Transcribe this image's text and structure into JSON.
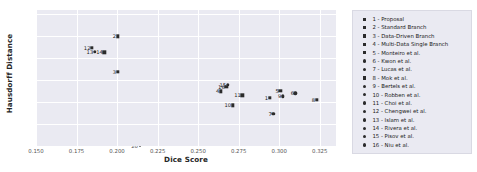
{
  "chart_data": {
    "type": "scatter",
    "title": "",
    "xlabel": "Dice Score",
    "ylabel": "Hausdorff Distance",
    "xlim": [
      0.15,
      0.335
    ],
    "ylim": [
      20,
      82
    ],
    "xticks": [
      "0.150",
      "0.175",
      "0.200",
      "0.225",
      "0.250",
      "0.275",
      "0.300",
      "0.325"
    ],
    "xtick_values": [
      0.15,
      0.175,
      0.2,
      0.225,
      0.25,
      0.275,
      0.3,
      0.325
    ],
    "yticks": [
      "20",
      "30",
      "40",
      "50",
      "60",
      "70",
      "80"
    ],
    "ytick_values": [
      20,
      30,
      40,
      50,
      60,
      70,
      80
    ],
    "grid": true,
    "legend_position": "right",
    "points": [
      {
        "label": "1",
        "name": "1 - Proposal",
        "x": 0.294,
        "y": 42.0,
        "marker": "square"
      },
      {
        "label": "2",
        "name": "2 - Standard Branch",
        "x": 0.2003,
        "y": 70.0,
        "marker": "square"
      },
      {
        "label": "3",
        "name": "3 - Data-Driven Branch",
        "x": 0.2003,
        "y": 53.8,
        "marker": "square"
      },
      {
        "label": "4",
        "name": "4 - Multi-Data Single Branch",
        "x": 0.264,
        "y": 45.0,
        "marker": "square"
      },
      {
        "label": "5",
        "name": "5 - Monteiro et al.",
        "x": 0.3006,
        "y": 45.3,
        "marker": "square"
      },
      {
        "label": "6",
        "name": "6 - Kwon et al.",
        "x": 0.31,
        "y": 44.0,
        "marker": "circle"
      },
      {
        "label": "7",
        "name": "7 - Lucas et al.",
        "x": 0.2963,
        "y": 34.6,
        "marker": "circle"
      },
      {
        "label": "8",
        "name": "8 - Mok et al.",
        "x": 0.323,
        "y": 41.0,
        "marker": "square"
      },
      {
        "label": "9",
        "name": "9 - Bertels et al.",
        "x": 0.3022,
        "y": 42.7,
        "marker": "circle"
      },
      {
        "label": "10",
        "name": "10 - Robben et al.",
        "x": 0.2712,
        "y": 38.6,
        "marker": "square"
      },
      {
        "label": "11",
        "name": "11 - Choi et al.",
        "x": 0.2772,
        "y": 43.2,
        "marker": "square"
      },
      {
        "label": "12",
        "name": "12 - Chengwei et al.",
        "x": 0.1845,
        "y": 64.9,
        "marker": "square"
      },
      {
        "label": "13",
        "name": "13 - Islam et al.",
        "x": 0.1862,
        "y": 63.0,
        "marker": "circle"
      },
      {
        "label": "14",
        "name": "14 - Rivera et al.",
        "x": 0.1922,
        "y": 62.8,
        "marker": "square"
      },
      {
        "label": "15",
        "name": "15 - Pisov et al.",
        "x": 0.2682,
        "y": 48.0,
        "marker": "circle"
      },
      {
        "label": "16",
        "name": "16 - Niu et al.",
        "x": 0.2673,
        "y": 47.0,
        "marker": "square"
      }
    ],
    "legend_entries": [
      {
        "label": "1 - Proposal",
        "marker": "square"
      },
      {
        "label": "2 - Standard Branch",
        "marker": "square"
      },
      {
        "label": "3 - Data-Driven Branch",
        "marker": "square"
      },
      {
        "label": "4 - Multi-Data Single Branch",
        "marker": "square"
      },
      {
        "label": "5 - Monteiro et al.",
        "marker": "square"
      },
      {
        "label": "6 - Kwon et al.",
        "marker": "circle"
      },
      {
        "label": "7 - Lucas et al.",
        "marker": "circle"
      },
      {
        "label": "8 - Mok et al.",
        "marker": "square"
      },
      {
        "label": "9 - Bertels et al.",
        "marker": "circle"
      },
      {
        "label": "10 - Robben et al.",
        "marker": "circle"
      },
      {
        "label": "11 - Choi et al.",
        "marker": "circle"
      },
      {
        "label": "12 - Chengwei et al.",
        "marker": "circle"
      },
      {
        "label": "13 - Islam et al.",
        "marker": "circle"
      },
      {
        "label": "14 - Rivera et al.",
        "marker": "circle"
      },
      {
        "label": "15 - Pisov et al.",
        "marker": "circle"
      },
      {
        "label": "16 - Niu et al.",
        "marker": "circle"
      }
    ],
    "colors": {
      "plot_background": "#eaeaf2",
      "gridline": "#ffffff",
      "marker": "#2b2b2b",
      "text": "#262626",
      "figure_background": "#ffffff"
    }
  }
}
